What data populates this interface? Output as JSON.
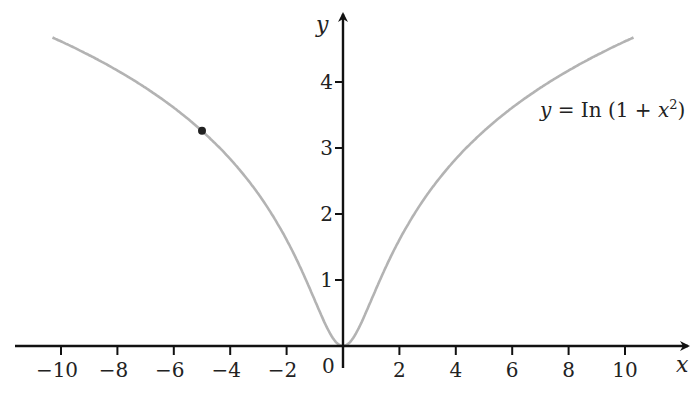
{
  "chart_data": {
    "type": "line",
    "title": "",
    "function": "y = ln(1 + x^2)",
    "annotation": {
      "text_parts": [
        "y",
        " = In (1 + ",
        "x",
        "2",
        ")"
      ],
      "position": "upper right"
    },
    "xlabel": "x",
    "ylabel": "y",
    "x_ticks": [
      -10,
      -8,
      -6,
      -4,
      -2,
      2,
      4,
      6,
      8,
      10
    ],
    "x_tick_labels": [
      "−10",
      "−8",
      "−6",
      "−4",
      "−2",
      "2",
      "4",
      "6",
      "8",
      "10"
    ],
    "y_ticks": [
      1,
      2,
      3,
      4
    ],
    "y_tick_labels": [
      "1",
      "2",
      "3",
      "4"
    ],
    "origin_label": "0",
    "xlim": [
      -10.3,
      10.3
    ],
    "ylim": [
      0,
      4.7
    ],
    "grid": false,
    "legend": null,
    "series": [
      {
        "name": "y = ln(1 + x^2)",
        "color": "#b3b3b3",
        "x": [
          -10.3,
          -9,
          -8,
          -7,
          -6,
          -5,
          -4,
          -3,
          -2,
          -1,
          -0.5,
          0,
          0.5,
          1,
          2,
          3,
          4,
          5,
          6,
          7,
          8,
          9,
          10.3
        ],
        "y": [
          4.67,
          4.41,
          4.17,
          3.91,
          3.61,
          3.26,
          2.83,
          2.3,
          1.61,
          0.69,
          0.22,
          0,
          0.22,
          0.69,
          1.61,
          2.3,
          2.83,
          3.26,
          3.61,
          3.91,
          4.17,
          4.41,
          4.67
        ]
      }
    ],
    "highlighted_point": {
      "x": -5,
      "y": 3.26,
      "color": "#222222"
    }
  },
  "labels": {
    "x_axis": "x",
    "y_axis": "y",
    "origin": "0",
    "eq_y": "y",
    "eq_mid": " = In (1 + ",
    "eq_x": "x",
    "eq_exp": "2",
    "eq_end": ")"
  }
}
